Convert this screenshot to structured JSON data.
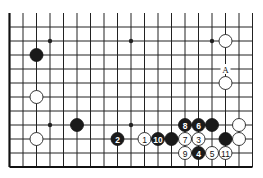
{
  "diagram": {
    "type": "go-board-diagram",
    "visible_columns": 19,
    "visible_rows": 11,
    "open_edges": [
      "top",
      "right"
    ],
    "board_edges": [
      "left",
      "bottom"
    ],
    "colors": {
      "black": "#1a1a1a",
      "white": "#ffffff",
      "line": "#222222"
    },
    "note": "columns numbered 1-19 from left; rows numbered 1-11 from top of visible area",
    "star_points": [
      {
        "col": 4,
        "row": 2
      },
      {
        "col": 10,
        "row": 2
      },
      {
        "col": 16,
        "row": 2
      },
      {
        "col": 4,
        "row": 8
      },
      {
        "col": 10,
        "row": 8
      }
    ],
    "stones": [
      {
        "color": "black",
        "col": 3,
        "row": 3,
        "label": ""
      },
      {
        "color": "white",
        "col": 3,
        "row": 6,
        "label": ""
      },
      {
        "color": "white",
        "col": 3,
        "row": 9,
        "label": ""
      },
      {
        "color": "black",
        "col": 6,
        "row": 8,
        "label": ""
      },
      {
        "color": "white",
        "col": 17,
        "row": 2,
        "label": ""
      },
      {
        "color": "white",
        "col": 17,
        "row": 5,
        "label": ""
      },
      {
        "color": "black",
        "col": 9,
        "row": 9,
        "label": "2"
      },
      {
        "color": "white",
        "col": 11,
        "row": 9,
        "label": "1"
      },
      {
        "color": "black",
        "col": 12,
        "row": 9,
        "label": "10"
      },
      {
        "color": "black",
        "col": 13,
        "row": 9,
        "label": ""
      },
      {
        "color": "white",
        "col": 14,
        "row": 9,
        "label": "7"
      },
      {
        "color": "white",
        "col": 15,
        "row": 9,
        "label": "3"
      },
      {
        "color": "black",
        "col": 17,
        "row": 9,
        "label": ""
      },
      {
        "color": "white",
        "col": 18,
        "row": 9,
        "label": ""
      },
      {
        "color": "black",
        "col": 14,
        "row": 8,
        "label": "8"
      },
      {
        "color": "black",
        "col": 15,
        "row": 8,
        "label": "6"
      },
      {
        "color": "black",
        "col": 16,
        "row": 8,
        "label": ""
      },
      {
        "color": "white",
        "col": 18,
        "row": 8,
        "label": ""
      },
      {
        "color": "white",
        "col": 14,
        "row": 10,
        "label": "9"
      },
      {
        "color": "black",
        "col": 15,
        "row": 10,
        "label": "4"
      },
      {
        "color": "white",
        "col": 16,
        "row": 10,
        "label": "5"
      },
      {
        "color": "white",
        "col": 17,
        "row": 10,
        "label": "11"
      }
    ],
    "point_labels": [
      {
        "col": 17,
        "row": 4,
        "text": "A"
      }
    ]
  }
}
